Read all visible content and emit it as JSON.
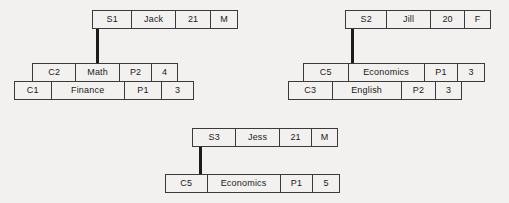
{
  "diagram": {
    "type": "record-linkage-diagram",
    "background_color": "#f2f1ef",
    "line_color": "#1c1c1c",
    "groups": [
      {
        "id": "group-s1",
        "student": {
          "id": "S1",
          "name": "Jack",
          "age": "21",
          "gender": "M"
        },
        "courses": [
          {
            "code": "C2",
            "title": "Math",
            "period": "P2",
            "credits": "4"
          },
          {
            "code": "C1",
            "title": "Finance",
            "period": "P1",
            "credits": "3"
          }
        ]
      },
      {
        "id": "group-s2",
        "student": {
          "id": "S2",
          "name": "Jill",
          "age": "20",
          "gender": "F"
        },
        "courses": [
          {
            "code": "C5",
            "title": "Economics",
            "period": "P1",
            "credits": "3"
          },
          {
            "code": "C3",
            "title": "English",
            "period": "P2",
            "credits": "3"
          }
        ]
      },
      {
        "id": "group-s3",
        "student": {
          "id": "S3",
          "name": "Jess",
          "age": "21",
          "gender": "M"
        },
        "courses": [
          {
            "code": "C5",
            "title": "Economics",
            "period": "P1",
            "credits": "5"
          }
        ]
      }
    ]
  }
}
